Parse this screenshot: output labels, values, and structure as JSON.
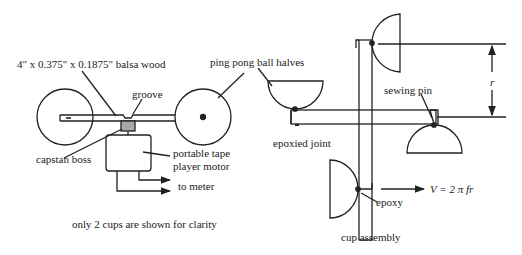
{
  "left_figure": {
    "balsa_label": "4\" x 0.375\" x 0.1875\" balsa wood",
    "groove_label": "groove",
    "capstan_label": "capstan boss",
    "motor_label_line1": "portable tape",
    "motor_label_line2": "player motor",
    "meter_label": "to meter",
    "caption": "only 2 cups are shown for clarity"
  },
  "right_figure": {
    "ping_pong_label": "ping pong ball halves",
    "sewing_pin_label": "sewing pin",
    "epoxied_joint_label": "epoxied joint",
    "epoxy_label": "epoxy",
    "radius_label": "r",
    "velocity_label": "V = 2 π fr",
    "caption": "cup assembly"
  },
  "colors": {
    "line": "#222222",
    "capstan_fill": "#a9a9a9"
  }
}
